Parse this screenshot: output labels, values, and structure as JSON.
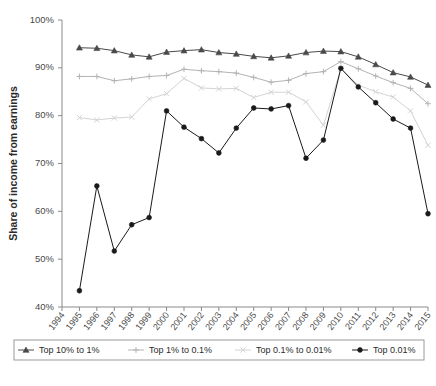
{
  "chart_data": {
    "type": "line",
    "title": "",
    "xlabel": "",
    "ylabel": "Share of income from earnings",
    "ylim": [
      40,
      100
    ],
    "ytick_labels": [
      "40%",
      "50%",
      "60%",
      "70%",
      "80%",
      "90%",
      "100%"
    ],
    "ytick_values": [
      40,
      50,
      60,
      70,
      80,
      90,
      100
    ],
    "grid": false,
    "legend_position": "bottom",
    "categories": [
      "1994",
      "1995",
      "1996",
      "1997",
      "1998",
      "1999",
      "2000",
      "2001",
      "2002",
      "2003",
      "2004",
      "2005",
      "2006",
      "2007",
      "2008",
      "2009",
      "2010",
      "2011",
      "2012",
      "2013",
      "2014",
      "2015"
    ],
    "x": [
      1994,
      1995,
      1996,
      1997,
      1998,
      1999,
      2000,
      2001,
      2002,
      2003,
      2004,
      2005,
      2006,
      2007,
      2008,
      2009,
      2010,
      2011,
      2012,
      2013,
      2014,
      2015
    ],
    "series": [
      {
        "name": "Top 10% to 1%",
        "marker": "triangle",
        "color": "#4a4a4a",
        "values": [
          null,
          94.2,
          94.1,
          93.6,
          92.7,
          92.3,
          93.3,
          93.6,
          93.8,
          93.2,
          92.9,
          92.4,
          92.1,
          92.5,
          93.2,
          93.5,
          93.4,
          92.3,
          90.7,
          89.0,
          88.1,
          86.4
        ]
      },
      {
        "name": "Top 1% to 0.1%",
        "marker": "plus",
        "color": "#b3b3b3",
        "values": [
          null,
          88.2,
          88.2,
          87.3,
          87.7,
          88.2,
          88.4,
          89.7,
          89.4,
          89.2,
          88.9,
          88.0,
          87.0,
          87.4,
          88.8,
          89.2,
          91.3,
          89.8,
          88.3,
          86.9,
          85.7,
          82.5
        ]
      },
      {
        "name": "Top 0.1% to 0.01%",
        "marker": "cross",
        "color": "#d4d4d4",
        "values": [
          null,
          79.6,
          79.1,
          79.5,
          79.7,
          83.5,
          84.6,
          87.8,
          85.8,
          85.6,
          85.7,
          83.8,
          84.9,
          84.9,
          82.9,
          78.0,
          89.8,
          86.4,
          85.0,
          83.9,
          81.0,
          73.8
        ]
      },
      {
        "name": "Top 0.01%",
        "marker": "circle",
        "color": "#1a1a1a",
        "values": [
          null,
          43.4,
          65.3,
          51.7,
          57.2,
          58.7,
          81.0,
          77.6,
          75.2,
          72.2,
          77.4,
          81.6,
          81.4,
          82.1,
          71.1,
          74.9,
          89.9,
          86.0,
          82.7,
          79.3,
          77.4,
          59.5
        ]
      }
    ]
  },
  "legend": {
    "items": [
      {
        "label": "Top 10% to 1%"
      },
      {
        "label": "Top 1% to 0.1%"
      },
      {
        "label": "Top 0.1% to 0.01%"
      },
      {
        "label": "Top 0.01%"
      }
    ]
  },
  "caption": {
    "text": ""
  }
}
